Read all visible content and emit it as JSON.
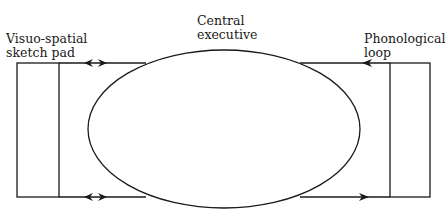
{
  "diagram": {
    "nodes": {
      "visuo_spatial": {
        "line1": "Visuo-spatial",
        "line2": "sketch pad"
      },
      "central_executive": {
        "line1": "Central",
        "line2": "executive"
      },
      "phonological": {
        "line1": "Phonological",
        "line2": "loop"
      }
    },
    "edges": [
      {
        "from": "central_executive",
        "to": "visuo_spatial",
        "position": "top",
        "arrow": "bidirectional"
      },
      {
        "from": "central_executive",
        "to": "visuo_spatial",
        "position": "bottom",
        "arrow": "bidirectional"
      },
      {
        "from": "phonological",
        "to": "central_executive",
        "position": "top",
        "arrow": "toward-central"
      },
      {
        "from": "central_executive",
        "to": "phonological",
        "position": "bottom",
        "arrow": "toward-phonological"
      }
    ],
    "colors": {
      "stroke": "#1a1a1a",
      "background": "#ffffff"
    }
  }
}
